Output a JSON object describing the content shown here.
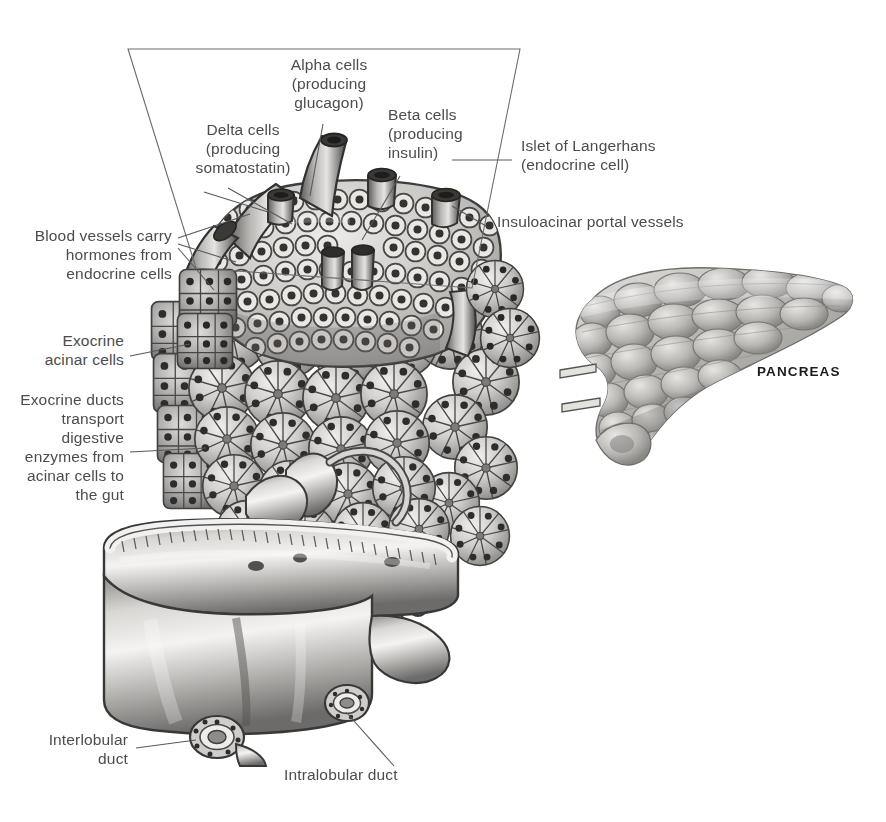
{
  "figure": {
    "background_color": "#ffffff",
    "text_color": "#4c4c4c",
    "line_color": "#55585c",
    "organ_label_color": "#1b1b1b"
  },
  "labels": {
    "alpha_cells": "Alpha cells\n(producing\nglucagon)",
    "delta_cells": "Delta cells\n(producing\nsomatostatin)",
    "beta_cells": "Beta cells\n(producing\ninsulin)",
    "islet": "Islet of Langerhans\n(endocrine cell)",
    "insuloacinar": "Insuloacinar portal vessels",
    "blood_vessels": "Blood vessels carry\nhormones from\nendocrine cells",
    "exocrine_acinar": "Exocrine\nacinar cells",
    "exocrine_ducts": "Exocrine ducts\ntransport\ndigestive\nenzymes from\nacinar cells to\nthe gut",
    "interlobular_duct": "Interlobular\nduct",
    "intralobular_duct": "Intralobular duct",
    "pancreas": "PANCREAS"
  }
}
